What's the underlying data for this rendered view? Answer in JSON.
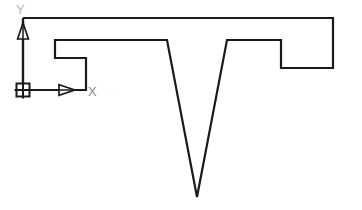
{
  "app": {
    "type": "cad-drawing-viewport",
    "background_color": "#ffffff"
  },
  "drawing": {
    "name": "profile-outline",
    "line_color": "#1a1a1a",
    "line_width": 2.2,
    "fill": "none",
    "outline_points": "23,18 333,18 333,68 281,68 281,40 227,40 197,197 167,40 55,40 55,58 86,58 86,90 23,90 23,18",
    "segments": [
      {
        "name": "top-edge",
        "from": [
          23,
          18
        ],
        "to": [
          333,
          18
        ]
      },
      {
        "name": "right-edge",
        "from": [
          333,
          18
        ],
        "to": [
          333,
          68
        ]
      },
      {
        "name": "right-notch-bottom",
        "from": [
          333,
          68
        ],
        "to": [
          281,
          68
        ]
      },
      {
        "name": "right-notch-riser",
        "from": [
          281,
          68
        ],
        "to": [
          281,
          40
        ]
      },
      {
        "name": "right-shoulder",
        "from": [
          281,
          40
        ],
        "to": [
          227,
          40
        ]
      },
      {
        "name": "v-right-leg",
        "from": [
          227,
          40
        ],
        "to": [
          197,
          197
        ]
      },
      {
        "name": "v-left-leg",
        "from": [
          197,
          197
        ],
        "to": [
          167,
          40
        ]
      },
      {
        "name": "left-shoulder",
        "from": [
          167,
          40
        ],
        "to": [
          55,
          40
        ]
      },
      {
        "name": "left-notch-drop",
        "from": [
          55,
          40
        ],
        "to": [
          55,
          58
        ]
      },
      {
        "name": "left-notch-bottom",
        "from": [
          55,
          58
        ],
        "to": [
          86,
          58
        ]
      },
      {
        "name": "left-notch-riser",
        "from": [
          86,
          58
        ],
        "to": [
          86,
          90
        ]
      },
      {
        "name": "bottom-edge",
        "from": [
          86,
          90
        ],
        "to": [
          23,
          90
        ]
      },
      {
        "name": "left-edge",
        "from": [
          23,
          90
        ],
        "to": [
          23,
          18
        ]
      }
    ]
  },
  "ucs_icon": {
    "name": "ucs-coordinate-icon",
    "origin": [
      23,
      90
    ],
    "origin_marker": {
      "type": "square-with-cross",
      "size": 13,
      "color": "#1a1a1a"
    },
    "x_axis": {
      "label": "X",
      "label_color": "#8a8a8a",
      "label_position": [
        91,
        95
      ],
      "axis_from": [
        23,
        90
      ],
      "axis_to": [
        86,
        90
      ],
      "arrow_type": "hollow-triangle",
      "arrow_tip": [
        74,
        90
      ]
    },
    "y_axis": {
      "label": "Y",
      "label_color": "#b0b0b0",
      "label_position": [
        19,
        13
      ],
      "axis_from": [
        23,
        90
      ],
      "axis_to": [
        23,
        18
      ],
      "arrow_type": "hollow-triangle",
      "arrow_tip": [
        23,
        30
      ]
    }
  }
}
